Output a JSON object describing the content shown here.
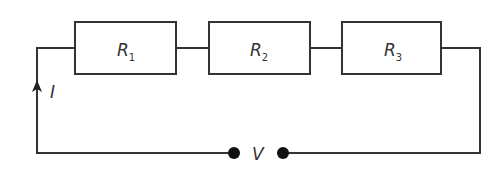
{
  "diagram": {
    "type": "series-circuit",
    "resistors": [
      {
        "symbol": "R",
        "subscript": "1"
      },
      {
        "symbol": "R",
        "subscript": "2"
      },
      {
        "symbol": "R",
        "subscript": "3"
      }
    ],
    "current_label": "I",
    "voltage_label": "V",
    "colors": {
      "line": "#333333",
      "background": "#ffffff"
    }
  }
}
